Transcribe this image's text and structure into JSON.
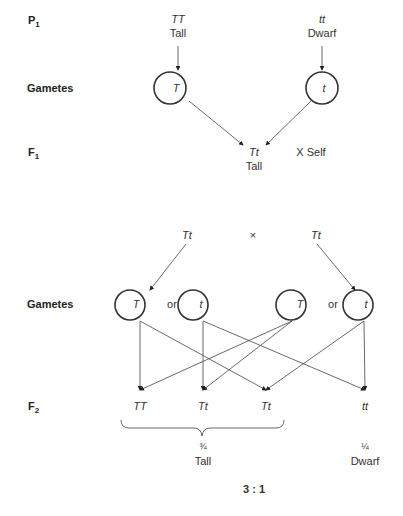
{
  "rows": {
    "p1": {
      "label": "P",
      "sub": "1"
    },
    "gametes1": {
      "label": "Gametes"
    },
    "f1": {
      "label": "F",
      "sub": "1"
    },
    "gametes2": {
      "label": "Gametes"
    },
    "f2": {
      "label": "F",
      "sub": "2"
    }
  },
  "p1": {
    "left": {
      "genotype": "TT",
      "phenotype": "Tall"
    },
    "right": {
      "genotype": "tt",
      "phenotype": "Dwarf"
    }
  },
  "gametes1": {
    "left": "T",
    "right": "t"
  },
  "f1": {
    "genotype": "Tt",
    "phenotype": "Tall",
    "cross": "X Self"
  },
  "cross2": {
    "left": "Tt",
    "symbol": "×",
    "right": "Tt"
  },
  "gametes2": {
    "g1": "T",
    "or1": "or",
    "g2": "t",
    "g3": "T",
    "or2": "or",
    "g4": "t"
  },
  "f2": {
    "genotypes": [
      "TT",
      "Tt",
      "Tt",
      "tt"
    ],
    "tall_fraction": "¾",
    "tall_label": "Tall",
    "dwarf_fraction": "¼",
    "dwarf_label": "Dwarf",
    "ratio": "3 : 1"
  }
}
